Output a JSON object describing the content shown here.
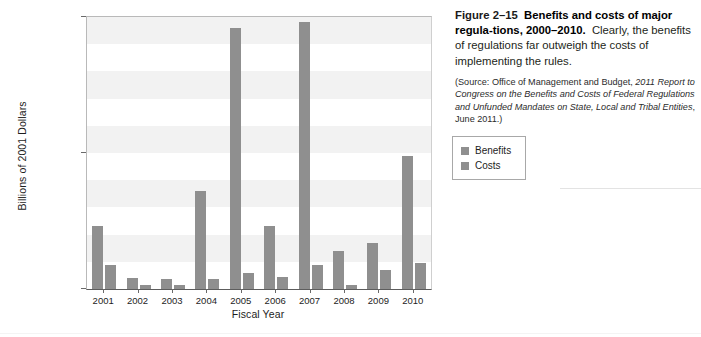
{
  "caption": {
    "figure_number": "Figure 2–15",
    "title": "Benefits and costs of major regula-tions, 2000–2010.",
    "title_line1": "Benefits and costs of major regula-",
    "title_line2": "tions, 2000–2010.",
    "description": "Clearly, the benefits of regulations far outweigh the costs of implementing the rules.",
    "source_prefix": "(Source: Office of Management and Budget, ",
    "source_italic": "2011 Report to Congress on the Benefits and Costs of Federal Regulations and Unfunded Mandates on State, Local and Tribal Entities",
    "source_suffix": ", June 2011.)",
    "source_full": "(Source: Office of Management and Budget, 2011 Report to Congress on the Benefits and Costs of Federal Regulations and Unfunded Mandates on State, Local and Tribal Entities, June 2011.)"
  },
  "legend": {
    "position": "right",
    "items": [
      {
        "label": "Benefits",
        "color": "#8f8f8f"
      },
      {
        "label": "Costs",
        "color": "#8f8f8f"
      }
    ]
  },
  "chart_data": {
    "type": "bar",
    "xlabel": "Fiscal Year",
    "ylabel": "Billions of 2001 Dollars",
    "categories": [
      "2001",
      "2002",
      "2003",
      "2004",
      "2005",
      "2006",
      "2007",
      "2008",
      "2009",
      "2010"
    ],
    "series": [
      {
        "name": "Benefits",
        "color": "#8f8f8f",
        "values": [
          23,
          4,
          3.5,
          36,
          96,
          23,
          98,
          14,
          17,
          49
        ]
      },
      {
        "name": "Costs",
        "color": "#8f8f8f",
        "values": [
          9,
          1.5,
          1.5,
          3.5,
          6,
          4.5,
          9,
          1.5,
          7,
          9.5
        ]
      }
    ],
    "ylim": [
      0,
      100
    ],
    "yticks": [
      0,
      50,
      100
    ],
    "ytick_labels": [
      "$0",
      "$50",
      "$100"
    ],
    "grid": false,
    "banding": true,
    "band_step": 10,
    "band_color": "#f2f2f2",
    "plot_background": "#ffffff"
  }
}
